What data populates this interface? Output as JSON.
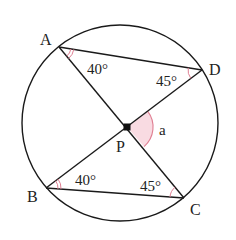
{
  "diagram": {
    "type": "geometry",
    "circle": {
      "cx": 120,
      "cy": 123,
      "r": 98
    },
    "colors": {
      "line": "#1a1a1a",
      "angle_mark": "#e07f93",
      "sector_fill": "#f9dbe2"
    },
    "points": {
      "A": {
        "label": "A",
        "x": 59,
        "y": 47
      },
      "D": {
        "label": "D",
        "x": 202,
        "y": 70
      },
      "B": {
        "label": "B",
        "x": 46,
        "y": 188
      },
      "C": {
        "label": "C",
        "x": 184,
        "y": 198
      },
      "P": {
        "label": "P",
        "x": 127,
        "y": 127
      }
    },
    "segments": [
      "AD",
      "AC",
      "BD",
      "BC"
    ],
    "angles": {
      "DAC": {
        "label": "40°",
        "marks": 2
      },
      "ADB": {
        "label": "45°",
        "marks": 1
      },
      "DBC": {
        "label": "40°",
        "marks": 2
      },
      "BCA": {
        "label": "45°",
        "marks": 1
      },
      "DPC": {
        "label": "a",
        "shaded": true
      }
    }
  }
}
